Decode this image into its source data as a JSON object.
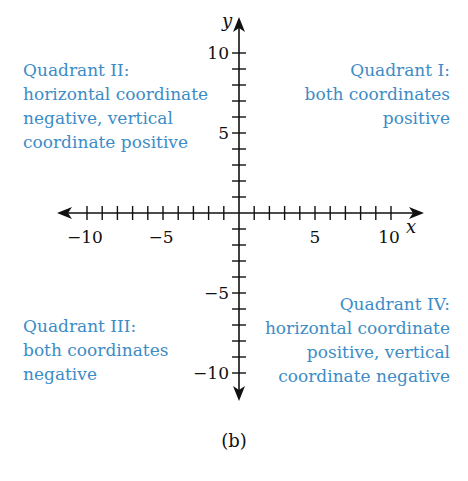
{
  "diagram": {
    "caption": "(b)",
    "axes": {
      "x_label": "x",
      "y_label": "y",
      "x_range": [
        -10,
        10
      ],
      "y_range": [
        -10,
        10
      ],
      "x_tick_labels": [
        "−10",
        "−5",
        "5",
        "10"
      ],
      "y_tick_labels": [
        "10",
        "5",
        "−5",
        "−10"
      ],
      "tick_step": 1
    },
    "quadrants": {
      "q1": {
        "lines": [
          "Quadrant I:",
          "both coordinates",
          "positive"
        ]
      },
      "q2": {
        "lines": [
          "Quadrant II:",
          "horizontal coordinate",
          "negative, vertical",
          "coordinate positive"
        ]
      },
      "q3": {
        "lines": [
          "Quadrant III:",
          "both coordinates",
          "negative"
        ]
      },
      "q4": {
        "lines": [
          "Quadrant IV:",
          "horizontal coordinate",
          "positive, vertical",
          "coordinate negative"
        ]
      }
    },
    "colors": {
      "label": "#3d8cc6",
      "axis": "#111111"
    }
  }
}
